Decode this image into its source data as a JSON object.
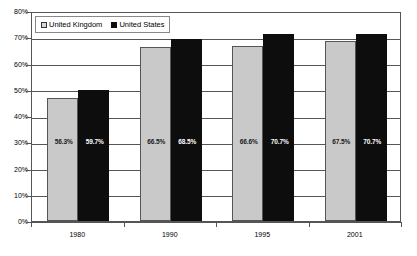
{
  "chart_data": {
    "type": "bar",
    "title": "",
    "xlabel": "",
    "ylabel": "",
    "ylim": [
      0,
      80
    ],
    "grid": true,
    "legend_position": "top-left",
    "categories": [
      "1980",
      "1990",
      "1995",
      "2001"
    ],
    "ytick_labels": [
      "0%",
      "10%",
      "20%",
      "30%",
      "40%",
      "50%",
      "60%",
      "70%",
      "80%"
    ],
    "ytick_values": [
      0,
      10,
      20,
      30,
      40,
      50,
      60,
      70,
      80
    ],
    "series": [
      {
        "name": "United Kingdom",
        "color": "#c9c9c9",
        "values": [
          56.3,
          66.5,
          66.6,
          67.5
        ],
        "data_labels": [
          "56.3%",
          "66.5%",
          "66.6%",
          "67.5%"
        ],
        "bar_tops_percent": [
          47.0,
          66.2,
          66.6,
          68.4
        ]
      },
      {
        "name": "United States",
        "color": "#0d0d0d",
        "values": [
          59.7,
          68.5,
          70.7,
          70.7
        ],
        "data_labels": [
          "59.7%",
          "68.5%",
          "70.7%",
          "70.7%"
        ],
        "bar_tops_percent": [
          50.0,
          69.4,
          71.3,
          71.3
        ]
      }
    ]
  },
  "legend": {
    "items": [
      {
        "label": "United Kingdom"
      },
      {
        "label": "United States"
      }
    ]
  }
}
